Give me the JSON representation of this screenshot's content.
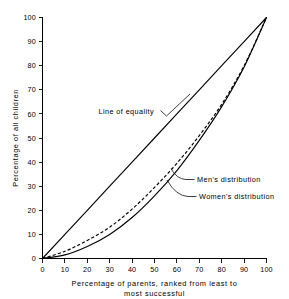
{
  "chart_data": {
    "type": "line",
    "title": "",
    "xlabel": "Percentage of parents, ranked from least to most successful",
    "ylabel": "Percentage of all children",
    "xlim": [
      0,
      100
    ],
    "ylim": [
      0,
      100
    ],
    "grid": false,
    "legend_position": "inline-annotations",
    "xticks": [
      "0",
      "10",
      "20",
      "30",
      "40",
      "50",
      "60",
      "70",
      "80",
      "90",
      "100"
    ],
    "yticks": [
      "0",
      "10",
      "20",
      "30",
      "40",
      "50",
      "60",
      "70",
      "80",
      "90",
      "100"
    ],
    "x": [
      0,
      10,
      20,
      30,
      40,
      50,
      60,
      70,
      80,
      90,
      100
    ],
    "series": [
      {
        "name": "Line of equality",
        "style": "solid",
        "values": [
          0,
          10,
          20,
          30,
          40,
          50,
          60,
          70,
          80,
          90,
          100
        ]
      },
      {
        "name": "Men's distribution",
        "style": "dashed",
        "values": [
          0,
          3,
          7.5,
          13,
          20.5,
          29.5,
          39.5,
          51,
          64,
          80,
          100
        ]
      },
      {
        "name": "Women's distribution",
        "style": "solid",
        "values": [
          0,
          1.5,
          5,
          10,
          17,
          26,
          36.5,
          49,
          63,
          79.5,
          100
        ]
      }
    ],
    "annotations": [
      {
        "text": "Line of equality",
        "target_x": 57,
        "target_y": 57
      },
      {
        "text": "Men's distribution",
        "target_x": 57,
        "target_y": 35
      },
      {
        "text": "Women's distribution",
        "target_x": 55,
        "target_y": 30
      }
    ]
  },
  "axes": {
    "y_title": "Percentage of all children",
    "x_title_line1": "Percentage of parents, ranked from least to",
    "x_title_line2": "most successful"
  },
  "labels": {
    "equality": "Line of equality",
    "men": "Men's distribution",
    "women": "Women's distribution"
  },
  "ticks": {
    "x": [
      "0",
      "10",
      "20",
      "30",
      "40",
      "50",
      "60",
      "70",
      "80",
      "90",
      "100"
    ],
    "y": [
      "0",
      "10",
      "20",
      "30",
      "40",
      "50",
      "60",
      "70",
      "80",
      "90",
      "100"
    ]
  },
  "colors": {
    "ink": "#000000",
    "background": "#ffffff"
  }
}
